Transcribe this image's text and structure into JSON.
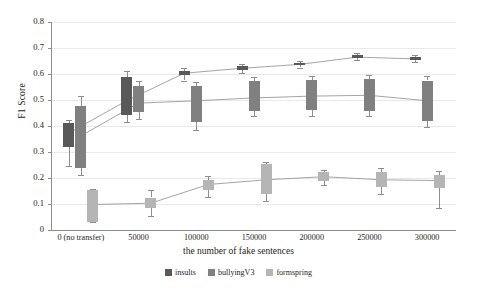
{
  "chart_data": {
    "type": "box",
    "title": "",
    "xlabel": "the number of fake sentences",
    "ylabel": "F1 Score",
    "ylim": [
      0,
      0.8
    ],
    "ytick_labels": [
      "0",
      "0.1",
      "0.2",
      "0.3",
      "0.4",
      "0.5",
      "0.6",
      "0.7",
      "0.8"
    ],
    "ytick_values": [
      0,
      0.1,
      0.2,
      0.3,
      0.4,
      0.5,
      0.6,
      0.7,
      0.8
    ],
    "grid": true,
    "legend_position": "bottom-center",
    "categories": [
      "0 (no transfer)",
      "50000",
      "100000",
      "150000",
      "200000",
      "250000",
      "300000"
    ],
    "series": [
      {
        "name": "insults",
        "color": "#595959",
        "boxes": [
          {
            "whisker_low": 0.247,
            "q1": 0.318,
            "median": 0.373,
            "q3": 0.41,
            "whisker_high": 0.425
          },
          {
            "whisker_low": 0.415,
            "q1": 0.443,
            "median": 0.497,
            "q3": 0.59,
            "whisker_high": 0.613
          },
          {
            "whisker_low": 0.575,
            "q1": 0.595,
            "median": 0.603,
            "q3": 0.612,
            "whisker_high": 0.625
          },
          {
            "whisker_low": 0.605,
            "q1": 0.617,
            "median": 0.622,
            "q3": 0.63,
            "whisker_high": 0.64
          },
          {
            "whisker_low": 0.625,
            "q1": 0.633,
            "median": 0.637,
            "q3": 0.643,
            "whisker_high": 0.65
          },
          {
            "whisker_low": 0.652,
            "q1": 0.66,
            "median": 0.665,
            "q3": 0.672,
            "whisker_high": 0.68
          },
          {
            "whisker_low": 0.645,
            "q1": 0.653,
            "median": 0.658,
            "q3": 0.665,
            "whisker_high": 0.672
          }
        ],
        "median_line": [
          0.373,
          0.497,
          0.603,
          0.622,
          0.637,
          0.665,
          0.658
        ]
      },
      {
        "name": "bullyingV3",
        "color": "#808080",
        "boxes": [
          {
            "whisker_low": 0.213,
            "q1": 0.238,
            "median": 0.362,
            "q3": 0.478,
            "whisker_high": 0.515
          },
          {
            "whisker_low": 0.428,
            "q1": 0.455,
            "median": 0.488,
            "q3": 0.553,
            "whisker_high": 0.572
          },
          {
            "whisker_low": 0.385,
            "q1": 0.417,
            "median": 0.497,
            "q3": 0.555,
            "whisker_high": 0.568
          },
          {
            "whisker_low": 0.437,
            "q1": 0.457,
            "median": 0.508,
            "q3": 0.573,
            "whisker_high": 0.588
          },
          {
            "whisker_low": 0.44,
            "q1": 0.46,
            "median": 0.515,
            "q3": 0.578,
            "whisker_high": 0.592
          },
          {
            "whisker_low": 0.437,
            "q1": 0.458,
            "median": 0.518,
            "q3": 0.58,
            "whisker_high": 0.597
          },
          {
            "whisker_low": 0.398,
            "q1": 0.42,
            "median": 0.497,
            "q3": 0.575,
            "whisker_high": 0.593
          }
        ],
        "median_line": [
          0.362,
          0.488,
          0.497,
          0.508,
          0.515,
          0.518,
          0.497
        ]
      },
      {
        "name": "formspring",
        "color": "#b5b5b5",
        "boxes": [
          {
            "whisker_low": 0.03,
            "q1": 0.032,
            "median": 0.098,
            "q3": 0.155,
            "whisker_high": 0.157
          },
          {
            "whisker_low": 0.055,
            "q1": 0.083,
            "median": 0.103,
            "q3": 0.125,
            "whisker_high": 0.152
          },
          {
            "whisker_low": 0.128,
            "q1": 0.155,
            "median": 0.175,
            "q3": 0.192,
            "whisker_high": 0.207
          },
          {
            "whisker_low": 0.113,
            "q1": 0.14,
            "median": 0.193,
            "q3": 0.253,
            "whisker_high": 0.263
          },
          {
            "whisker_low": 0.173,
            "q1": 0.19,
            "median": 0.205,
            "q3": 0.222,
            "whisker_high": 0.232
          },
          {
            "whisker_low": 0.137,
            "q1": 0.165,
            "median": 0.193,
            "q3": 0.222,
            "whisker_high": 0.237
          },
          {
            "whisker_low": 0.085,
            "q1": 0.163,
            "median": 0.19,
            "q3": 0.213,
            "whisker_high": 0.228
          }
        ],
        "median_line": [
          0.098,
          0.103,
          0.175,
          0.193,
          0.205,
          0.193,
          0.19
        ]
      }
    ]
  },
  "legend": {
    "items": [
      {
        "label": "insults",
        "color": "#595959"
      },
      {
        "label": "bullyingV3",
        "color": "#808080"
      },
      {
        "label": "formspring",
        "color": "#b5b5b5"
      }
    ]
  }
}
